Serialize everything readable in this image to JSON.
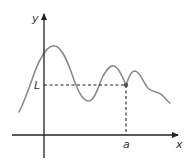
{
  "diagram": {
    "labels": {
      "y_axis": "y",
      "x_axis": "x",
      "limit": "L",
      "point": "a"
    },
    "colors": {
      "axes": "#222222",
      "curve": "#8c8c8c",
      "dashes": "#222222",
      "point": "#555555"
    }
  }
}
